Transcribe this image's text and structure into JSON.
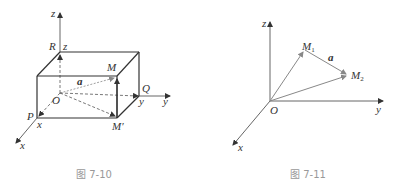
{
  "figures": [
    {
      "caption": "图 7-10",
      "axis_labels": {
        "x": "x",
        "y": "y",
        "z": "z"
      },
      "points": {
        "origin": "O",
        "R": "R",
        "R_coord": "z",
        "P": "P",
        "P_coord": "x",
        "Q": "Q",
        "Q_coord": "y",
        "M": "M",
        "M_prime": "M′"
      },
      "vector": "a"
    },
    {
      "caption": "图 7-11",
      "axis_labels": {
        "x": "x",
        "y": "y",
        "z": "z"
      },
      "points": {
        "origin": "O",
        "M1_base": "M",
        "M1_sub": "1",
        "M2_base": "M",
        "M2_sub": "2"
      },
      "vector": "a"
    }
  ],
  "colors": {
    "line": "#333333",
    "vector": "#888888",
    "caption": "#999999"
  }
}
